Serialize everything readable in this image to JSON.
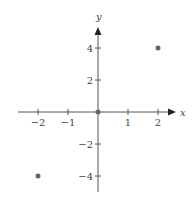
{
  "chart_data": {
    "type": "scatter",
    "title": "",
    "xlabel": "x",
    "ylabel": "y",
    "xlim": [
      -2.6,
      2.6
    ],
    "ylim": [
      -5,
      5.2
    ],
    "grid": false,
    "x_ticks": [
      -2,
      -1,
      1,
      2
    ],
    "x_tick_labels": [
      "−2",
      "−1",
      "1",
      "2"
    ],
    "y_ticks": [
      4,
      2,
      -2,
      -4
    ],
    "y_tick_labels": [
      "4",
      "2",
      "−2",
      "−4"
    ],
    "series": [
      {
        "name": "points",
        "x": [
          -2,
          0,
          2
        ],
        "y": [
          -4,
          0,
          4
        ]
      }
    ],
    "colors": {
      "axis": "#555555",
      "point": "#666666",
      "text": "#444444"
    }
  }
}
